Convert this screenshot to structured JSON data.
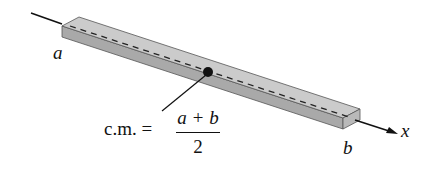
{
  "diagram": {
    "labels": {
      "left_end": "a",
      "right_end": "b",
      "axis": "x"
    },
    "center_of_mass": {
      "prefix": "c.m. =",
      "numerator": "a + b",
      "denominator": "2"
    },
    "colors": {
      "bar_top": "#c9c9c9",
      "bar_side": "#a8a8a8",
      "bar_end": "#b8b8b8",
      "outline": "#555555",
      "ink": "#111111"
    }
  }
}
